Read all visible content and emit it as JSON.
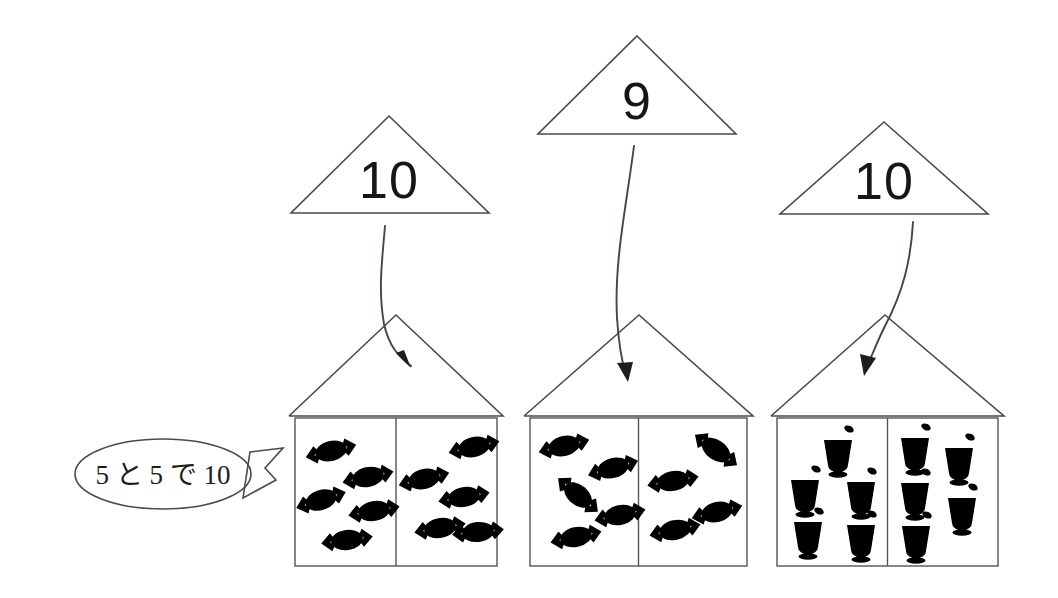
{
  "worksheet": {
    "title": "Number composition worksheet with triangles and houses",
    "background_color": "#ffffff",
    "ink_color": "#4a4a48"
  },
  "speech_bubble": {
    "name": "speech-bubble",
    "text": "5 と 5 で 10",
    "reading": "go to go de juu",
    "meaning": "5 and 5 makes 10",
    "center_x": 163,
    "center_y": 474,
    "rx": 88,
    "ry": 35,
    "tail_points": "250,452 283,448 265,468 276,480 243,498"
  },
  "groups": [
    {
      "id": "group-1",
      "total_label": "10",
      "item_type": "candy-wrapped-dotted",
      "item_color": "#8a3c26",
      "item_accent": "#e8ded0",
      "left_count": 5,
      "right_count": 5,
      "triangle": {
        "apex_x": 389,
        "apex_y": 116,
        "left_x": 291,
        "right_x": 489,
        "base_y": 213
      },
      "house": {
        "left": 289,
        "right": 503,
        "roof_apex_x": 396,
        "roof_apex_y": 315,
        "roof_base_y": 416,
        "body_bottom": 566,
        "divider_x": 396
      },
      "arrow": {
        "d": "M 385 226 C 382 262 378 290 384 324 C 389 346 398 356 411 366",
        "head": "411,368 396,353 404,350"
      },
      "left_items": [
        {
          "x": 331,
          "y": 451,
          "rot": -14,
          "upright": false
        },
        {
          "x": 368,
          "y": 477,
          "rot": -12,
          "upright": false
        },
        {
          "x": 321,
          "y": 500,
          "rot": 72,
          "upright": true
        },
        {
          "x": 374,
          "y": 511,
          "rot": -10,
          "upright": false
        },
        {
          "x": 347,
          "y": 540,
          "rot": -8,
          "upright": false
        }
      ],
      "right_items": [
        {
          "x": 474,
          "y": 447,
          "rot": -13,
          "upright": false
        },
        {
          "x": 424,
          "y": 479,
          "rot": 76,
          "upright": true
        },
        {
          "x": 464,
          "y": 497,
          "rot": -10,
          "upright": false
        },
        {
          "x": 440,
          "y": 528,
          "rot": 80,
          "upright": true
        },
        {
          "x": 478,
          "y": 532,
          "rot": 84,
          "upright": true
        }
      ]
    },
    {
      "id": "group-2",
      "total_label": "9",
      "item_type": "candy-striped",
      "item_color": "#2f5b3c",
      "item_accent": "#f2f2ec",
      "left_count": 5,
      "right_count": 4,
      "triangle": {
        "apex_x": 637,
        "apex_y": 36,
        "left_x": 538,
        "right_x": 736,
        "base_y": 134
      },
      "house": {
        "left": 524,
        "right": 753,
        "roof_apex_x": 639,
        "roof_apex_y": 315,
        "roof_base_y": 416,
        "body_bottom": 566,
        "divider_x": 639
      },
      "arrow": {
        "d": "M 634 146 C 626 208 614 262 617 318 C 619 348 622 362 626 376",
        "head": "628,382 617,363 633,362"
      },
      "left_items": [
        {
          "x": 564,
          "y": 446,
          "rot": -14,
          "upright": false
        },
        {
          "x": 613,
          "y": 468,
          "rot": -16,
          "upright": false
        },
        {
          "x": 578,
          "y": 495,
          "rot": 40,
          "upright": false
        },
        {
          "x": 620,
          "y": 515,
          "rot": -12,
          "upright": false
        },
        {
          "x": 576,
          "y": 537,
          "rot": -12,
          "upright": false
        }
      ],
      "right_items": [
        {
          "x": 716,
          "y": 450,
          "rot": 36,
          "upright": false
        },
        {
          "x": 673,
          "y": 481,
          "rot": -10,
          "upright": false
        },
        {
          "x": 717,
          "y": 512,
          "rot": -14,
          "upright": false
        },
        {
          "x": 675,
          "y": 530,
          "rot": -12,
          "upright": false
        }
      ]
    },
    {
      "id": "group-3",
      "total_label": "10",
      "item_type": "pudding-glass",
      "item_color": "#d08a28",
      "item_accent": "#e6eae6",
      "left_count": 5,
      "right_count": 5,
      "triangle": {
        "apex_x": 884,
        "apex_y": 122,
        "left_x": 780,
        "right_x": 988,
        "base_y": 214
      },
      "house": {
        "left": 771,
        "right": 1004,
        "roof_apex_x": 885,
        "roof_apex_y": 315,
        "roof_base_y": 416,
        "body_bottom": 566,
        "divider_x": 885
      },
      "arrow": {
        "d": "M 913 222 C 911 260 903 292 885 326 C 876 344 872 356 866 368",
        "head": "864,376 860,354 876,358"
      },
      "left_items": [
        {
          "x": 838,
          "y": 452,
          "rot": 0
        },
        {
          "x": 805,
          "y": 492,
          "rot": 0
        },
        {
          "x": 861,
          "y": 494,
          "rot": 0
        },
        {
          "x": 808,
          "y": 534,
          "rot": 0
        },
        {
          "x": 861,
          "y": 537,
          "rot": 0
        }
      ],
      "right_items": [
        {
          "x": 915,
          "y": 450,
          "rot": 0
        },
        {
          "x": 959,
          "y": 460,
          "rot": 0
        },
        {
          "x": 915,
          "y": 495,
          "rot": 0
        },
        {
          "x": 962,
          "y": 510,
          "rot": 0
        },
        {
          "x": 916,
          "y": 538,
          "rot": 0
        }
      ]
    }
  ]
}
